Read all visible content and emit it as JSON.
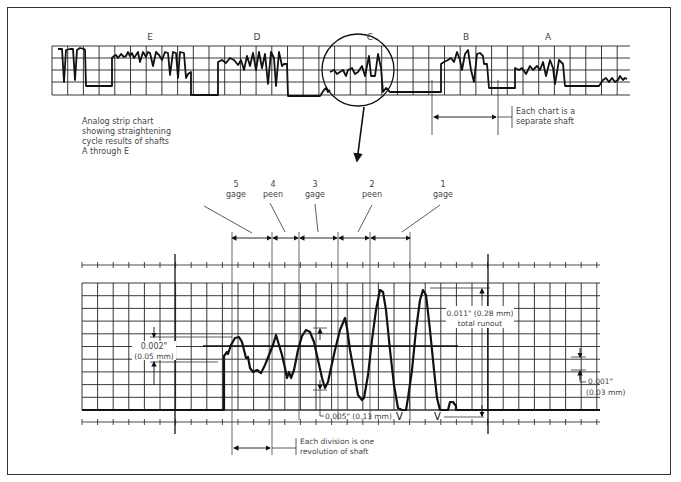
{
  "figure": {
    "top_strip": {
      "shaft_labels": [
        "E",
        "D",
        "C",
        "B",
        "A"
      ],
      "caption_lines": [
        "Analog strip chart",
        "showing straightening",
        "cycle results of shafts",
        "A through E"
      ],
      "note_lines": [
        "Each chart is a",
        "separate shaft"
      ]
    },
    "stages": [
      {
        "num": "5",
        "name": "gage"
      },
      {
        "num": "4",
        "name": "peen"
      },
      {
        "num": "3",
        "name": "gage"
      },
      {
        "num": "2",
        "name": "peen"
      },
      {
        "num": "1",
        "name": "gage"
      }
    ],
    "annotations": {
      "left_dim_in": "0.002\"",
      "left_dim_mm": "(0.05 mm)",
      "total_runout_line1": "0.011\" (0.28 mm)",
      "total_runout_line2": "total runout",
      "mid_dim": "0.005\" (0.13 mm)",
      "right_dim_in": "0.001\"",
      "right_dim_mm": "(0.03 mm)",
      "division_note_line1": "Each division is one",
      "division_note_line2": "revolution of shaft"
    }
  }
}
